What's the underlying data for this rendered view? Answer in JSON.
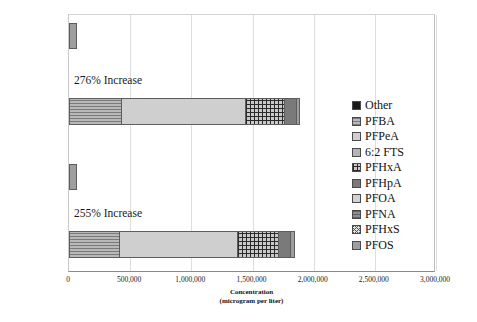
{
  "chart_data": {
    "type": "bar",
    "orientation": "horizontal",
    "stacked": true,
    "title": "",
    "xlabel": "Concentration",
    "xlabel_sub": "(microgram per liter)",
    "ylabel": "",
    "xlim": [
      0,
      3000000
    ],
    "xticks": [
      0,
      500000,
      1000000,
      1500000,
      2000000,
      2500000,
      3000000
    ],
    "xtick_labels": [
      "0",
      "500,000",
      "1,000,000",
      "1,500,000",
      "2,000,000",
      "2,500,000",
      "3,000,000"
    ],
    "grid": true,
    "legend_position": "right",
    "categories": [
      "Sample 2 Pre-TOP",
      "Sample 2 Post-TOP",
      "Sample 1 Pre-TOP",
      "Sample 1 Post-TOP"
    ],
    "category_lines": [
      [
        "Sample 2",
        "Pre-TOP"
      ],
      [
        "Sample 2",
        "Post-TOP"
      ],
      [
        "Sample 1",
        "Pre-TOP"
      ],
      [
        "Sample 1",
        "Post-TOP"
      ]
    ],
    "series": [
      {
        "name": "Other",
        "values": [
          0,
          0,
          0,
          0
        ]
      },
      {
        "name": "PFBA",
        "values": [
          0,
          430000,
          0,
          415000
        ]
      },
      {
        "name": "PFPeA",
        "values": [
          0,
          1015000,
          0,
          965000
        ]
      },
      {
        "name": "6:2 FTS",
        "values": [
          0,
          0,
          0,
          0
        ]
      },
      {
        "name": "PFHxA",
        "values": [
          0,
          320000,
          0,
          340000
        ]
      },
      {
        "name": "PFHpA",
        "values": [
          0,
          95000,
          0,
          95000
        ]
      },
      {
        "name": "PFOA",
        "values": [
          0,
          0,
          0,
          0
        ]
      },
      {
        "name": "PFNA",
        "values": [
          0,
          0,
          0,
          0
        ]
      },
      {
        "name": "PFHxS",
        "values": [
          0,
          0,
          0,
          0
        ]
      },
      {
        "name": "PFOS",
        "values": [
          65000,
          30000,
          62000,
          35000
        ]
      }
    ],
    "totals": [
      65000,
      1890000,
      62000,
      1850000
    ],
    "annotations": [
      {
        "text": "276% Increase",
        "category": "Sample 2 Post-TOP"
      },
      {
        "text": "255% Increase",
        "category": "Sample 1 Post-TOP"
      }
    ]
  },
  "legend": {
    "items": [
      {
        "label": "Other",
        "pattern": "p-other"
      },
      {
        "label": "PFBA",
        "pattern": "p-pfba"
      },
      {
        "label": "PFPeA",
        "pattern": "p-pfpea"
      },
      {
        "label": "6:2 FTS",
        "pattern": "p-62fts"
      },
      {
        "label": "PFHxA",
        "pattern": "p-pfhxa"
      },
      {
        "label": "PFHpA",
        "pattern": "p-pfhpa"
      },
      {
        "label": "PFOA",
        "pattern": "p-pfoa"
      },
      {
        "label": "PFNA",
        "pattern": "p-pfna"
      },
      {
        "label": "PFHxS",
        "pattern": "p-pfhxs"
      },
      {
        "label": "PFOS",
        "pattern": "p-pfos"
      }
    ]
  },
  "bars": [
    {
      "category": "Sample 2 Pre-TOP",
      "top": 22,
      "height": 26,
      "annotation": null,
      "segments": [
        {
          "series": "PFOS",
          "pattern": "p-pfos",
          "value": 65000
        }
      ]
    },
    {
      "category": "Sample 2 Post-TOP",
      "top": 97,
      "height": 27,
      "annotation": "276% Increase",
      "annotation_left": 74,
      "annotation_top": 74,
      "segments": [
        {
          "series": "PFBA",
          "pattern": "p-pfba",
          "value": 430000
        },
        {
          "series": "PFPeA",
          "pattern": "p-pfpea",
          "value": 1015000
        },
        {
          "series": "PFHxA",
          "pattern": "p-pfhxa",
          "value": 320000
        },
        {
          "series": "PFHpA",
          "pattern": "p-pfhpa",
          "value": 95000
        },
        {
          "series": "PFOS",
          "pattern": "p-pfos",
          "value": 30000
        }
      ]
    },
    {
      "category": "Sample 1 Pre-TOP",
      "top": 163,
      "height": 26,
      "annotation": null,
      "segments": [
        {
          "series": "PFOS",
          "pattern": "p-pfos",
          "value": 62000
        }
      ]
    },
    {
      "category": "Sample 1 Post-TOP",
      "top": 230,
      "height": 27,
      "annotation": "255% Increase",
      "annotation_left": 74,
      "annotation_top": 207,
      "segments": [
        {
          "series": "PFBA",
          "pattern": "p-pfba",
          "value": 415000
        },
        {
          "series": "PFPeA",
          "pattern": "p-pfpea",
          "value": 965000
        },
        {
          "series": "PFHxA",
          "pattern": "p-pfhxa",
          "value": 340000
        },
        {
          "series": "PFHpA",
          "pattern": "p-pfhpa",
          "value": 95000
        },
        {
          "series": "PFOS",
          "pattern": "p-pfos",
          "value": 35000
        }
      ]
    }
  ],
  "geometry": {
    "plot_left": 68,
    "plot_top": 14,
    "plot_width": 367,
    "plot_height": 258,
    "x_max": 3000000
  }
}
